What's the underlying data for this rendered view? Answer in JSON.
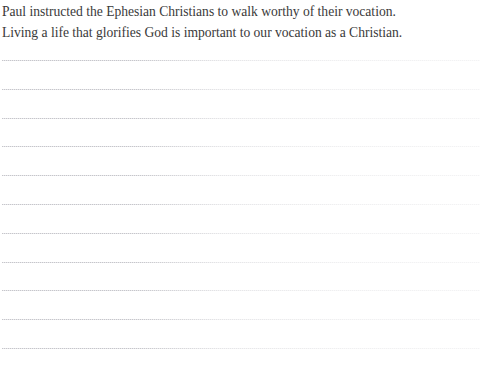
{
  "document": {
    "background_color": "#ffffff",
    "text_color": "#3a3a3a",
    "rule_color": "#c6c6ca",
    "prose": [
      "Paul instructed the Ephesian Christians to walk worthy of their vocation.",
      "Living a life that glorifies God is important to our vocation as a Christian."
    ],
    "writing_lines": {
      "count": 11,
      "first_top": 60,
      "spacing": 28.8,
      "left": 2,
      "width": 478
    }
  }
}
